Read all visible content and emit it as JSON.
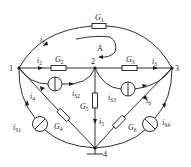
{
  "diagram": {
    "type": "circuit",
    "nodes": [
      {
        "id": "1",
        "label": "1"
      },
      {
        "id": "2",
        "label": "2"
      },
      {
        "id": "3",
        "label": "3"
      },
      {
        "id": "4",
        "label": "4"
      }
    ],
    "loop_label": "A",
    "conductances": {
      "G1": {
        "letter": "G",
        "sub": "1"
      },
      "G2": {
        "letter": "G",
        "sub": "2"
      },
      "G3": {
        "letter": "G",
        "sub": "3"
      },
      "G4": {
        "letter": "G",
        "sub": "4"
      },
      "G5": {
        "letter": "G",
        "sub": "5"
      },
      "G6": {
        "letter": "G",
        "sub": "6"
      }
    },
    "currents": {
      "i1": {
        "letter": "i",
        "sub": "1"
      },
      "i2": {
        "letter": "i",
        "sub": "2"
      },
      "i3": {
        "letter": "i",
        "sub": "3"
      },
      "i4": {
        "letter": "i",
        "sub": "4"
      },
      "i5": {
        "letter": "i",
        "sub": "5"
      },
      "i6": {
        "letter": "i",
        "sub": "6"
      }
    },
    "sources": {
      "iS1": {
        "letter": "i",
        "sub": "S1"
      },
      "iS2": {
        "letter": "i",
        "sub": "S2"
      },
      "iS3": {
        "letter": "i",
        "sub": "S3"
      },
      "iS4": {
        "letter": "i",
        "sub": "S4"
      }
    },
    "branches": [
      {
        "from": "1",
        "to": "3",
        "element": "G1",
        "current": "i1"
      },
      {
        "from": "1",
        "to": "2",
        "element": "G2",
        "current": "i2"
      },
      {
        "from": "2",
        "to": "3",
        "element": "G3",
        "current": "i3"
      },
      {
        "from": "4",
        "to": "1",
        "element": "G4",
        "current": "i4"
      },
      {
        "from": "2",
        "to": "4",
        "element": "G5",
        "current": "i5"
      },
      {
        "from": "4",
        "to": "3",
        "element": "G6",
        "current": "i6"
      },
      {
        "from": "4",
        "to": "1",
        "element": "iS1"
      },
      {
        "from": "1",
        "to": "2",
        "element": "iS2"
      },
      {
        "from": "2",
        "to": "3",
        "element": "iS3"
      },
      {
        "from": "4",
        "to": "3",
        "element": "iS4"
      }
    ],
    "ground_node": "4"
  }
}
